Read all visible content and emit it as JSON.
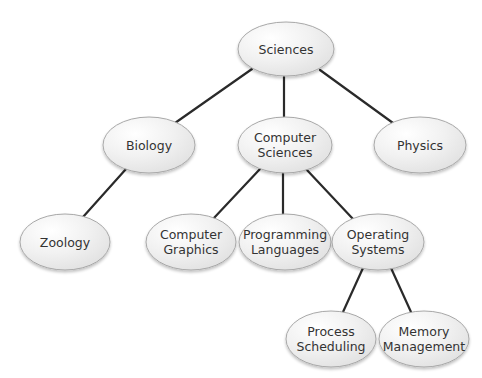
{
  "diagram": {
    "type": "tree",
    "colors": {
      "line": "#2a2a2a",
      "node_border": "#a8a8a8",
      "node_fill_light": "#ffffff",
      "node_fill_dark": "#e4e4e4",
      "text": "#333333",
      "background": "#ffffff"
    },
    "nodes": [
      {
        "id": "sciences",
        "lines": [
          "Sciences"
        ],
        "cx": 286,
        "cy": 49,
        "rx": 48,
        "ry": 27
      },
      {
        "id": "biology",
        "lines": [
          "Biology"
        ],
        "cx": 149,
        "cy": 145,
        "rx": 46,
        "ry": 28
      },
      {
        "id": "computer-sciences",
        "lines": [
          "Computer",
          "Sciences"
        ],
        "cx": 285,
        "cy": 145,
        "rx": 47,
        "ry": 28
      },
      {
        "id": "physics",
        "lines": [
          "Physics"
        ],
        "cx": 420,
        "cy": 145,
        "rx": 46,
        "ry": 28
      },
      {
        "id": "zoology",
        "lines": [
          "Zoology"
        ],
        "cx": 65,
        "cy": 242,
        "rx": 45,
        "ry": 28
      },
      {
        "id": "computer-graphics",
        "lines": [
          "Computer",
          "Graphics"
        ],
        "cx": 191,
        "cy": 242,
        "rx": 45,
        "ry": 28
      },
      {
        "id": "programming-languages",
        "lines": [
          "Programming",
          "Languages"
        ],
        "cx": 285,
        "cy": 242,
        "rx": 46,
        "ry": 28
      },
      {
        "id": "operating-systems",
        "lines": [
          "Operating",
          "Systems"
        ],
        "cx": 378,
        "cy": 242,
        "rx": 46,
        "ry": 28
      },
      {
        "id": "process-scheduling",
        "lines": [
          "Process",
          "Scheduling"
        ],
        "cx": 331,
        "cy": 339,
        "rx": 45,
        "ry": 28
      },
      {
        "id": "memory-management",
        "lines": [
          "Memory",
          "Management"
        ],
        "cx": 424,
        "cy": 339,
        "rx": 45,
        "ry": 28
      }
    ],
    "edges": [
      {
        "from": "sciences",
        "to": "biology",
        "x1": 252,
        "y1": 69,
        "x2": 175,
        "y2": 123
      },
      {
        "from": "sciences",
        "to": "computer-sciences",
        "x1": 284,
        "y1": 77,
        "x2": 284,
        "y2": 117
      },
      {
        "from": "sciences",
        "to": "physics",
        "x1": 320,
        "y1": 70,
        "x2": 393,
        "y2": 123
      },
      {
        "from": "biology",
        "to": "zoology",
        "x1": 126,
        "y1": 169,
        "x2": 83,
        "y2": 217
      },
      {
        "from": "computer-sciences",
        "to": "computer-graphics",
        "x1": 260,
        "y1": 169,
        "x2": 213,
        "y2": 219
      },
      {
        "from": "computer-sciences",
        "to": "programming-languages",
        "x1": 283,
        "y1": 173,
        "x2": 283,
        "y2": 214
      },
      {
        "from": "computer-sciences",
        "to": "operating-systems",
        "x1": 306,
        "y1": 169,
        "x2": 353,
        "y2": 219
      },
      {
        "from": "operating-systems",
        "to": "process-scheduling",
        "x1": 363,
        "y1": 268,
        "x2": 343,
        "y2": 312
      },
      {
        "from": "operating-systems",
        "to": "memory-management",
        "x1": 391,
        "y1": 268,
        "x2": 411,
        "y2": 312
      }
    ]
  }
}
